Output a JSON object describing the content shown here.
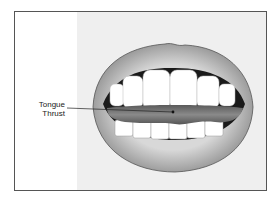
{
  "diagram": {
    "labels": [
      {
        "line1": "Tongue",
        "line2": "Thrust"
      }
    ],
    "colors": {
      "frame_border": "#555555",
      "panel_background": "#efefef",
      "lip": "#9a9a9a",
      "tongue": "#6f6f6f",
      "teeth": "#ffffff"
    }
  }
}
